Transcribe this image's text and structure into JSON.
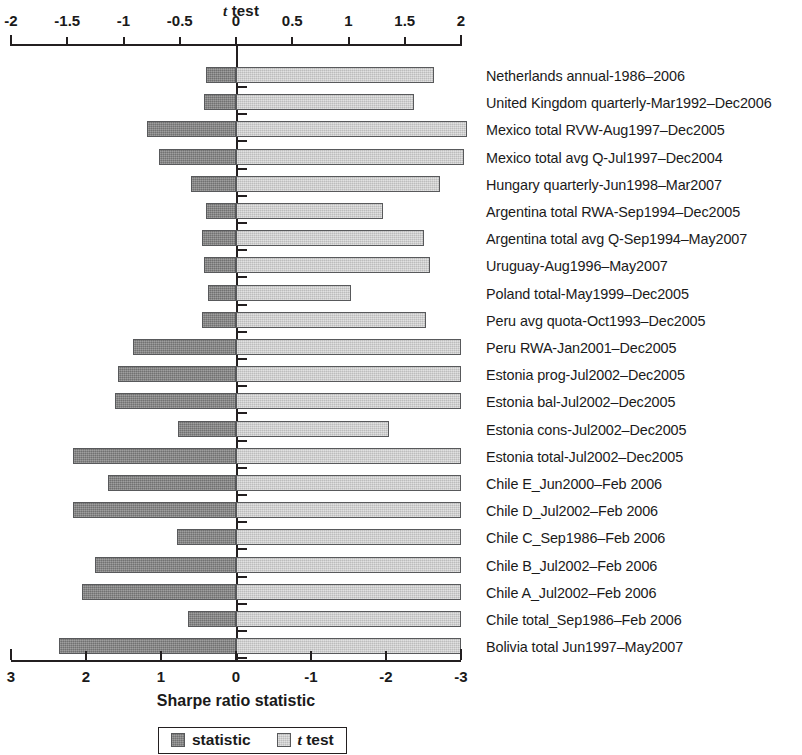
{
  "chart_data": {
    "type": "bar",
    "orientation": "horizontal",
    "title": "t test",
    "xlabel": "Sharpe ratio statistic",
    "ylabel": "",
    "grid": false,
    "legend_position": "bottom",
    "top_axis": {
      "label": "t test",
      "ticks": [
        "-2",
        "-1.5",
        "-1",
        "-0.5",
        "0",
        "0.5",
        "1",
        "1.5",
        "2"
      ],
      "tick_values": [
        -2,
        -1.5,
        -1,
        -0.5,
        0,
        0.5,
        1,
        1.5,
        2
      ],
      "range": [
        -2,
        2
      ]
    },
    "bottom_axis": {
      "label": "Sharpe ratio statistic",
      "ticks": [
        "3",
        "2",
        "1",
        "0",
        "-1",
        "-2",
        "-3"
      ],
      "tick_values": [
        3,
        2,
        1,
        0,
        -1,
        -2,
        -3
      ],
      "range": [
        3,
        -3
      ],
      "reversed": true
    },
    "legend": [
      {
        "name": "statistic",
        "color": "#878787"
      },
      {
        "name": "t test",
        "color": "#d2d2d2"
      }
    ],
    "categories": [
      "Netherlands annual-1986–2006",
      "United Kingdom quarterly-Mar1992–Dec2006",
      "Mexico total RVW-Aug1997–Dec2005",
      "Mexico total avg Q-Jul1997–Dec2004",
      "Hungary quarterly-Jun1998–Mar2007",
      "Argentina total RWA-Sep1994–Dec2005",
      "Argentina total avg Q-Sep1994–May2007",
      "Uruguay-Aug1996–May2007",
      "Poland total-May1999–Dec2005",
      "Peru avg quota-Oct1993–Dec2005",
      "Peru RWA-Jan2001–Dec2005",
      "Estonia prog-Jul2002–Dec2005",
      "Estonia bal-Jul2002–Dec2005",
      "Estonia cons-Jul2002–Dec2005",
      "Estonia total-Jul2002–Dec2005",
      "Chile E_Jun2000–Feb 2006",
      "Chile D_Jul2002–Feb 2006",
      "Chile C_Sep1986–Feb 2006",
      "Chile B_Jul2002–Feb 2006",
      "Chile A_Jul2002–Feb 2006",
      "Chile total_Sep1986–Feb 2006",
      "Bolivia total Jun1997–May2007"
    ],
    "series": [
      {
        "name": "statistic",
        "color": "#878787",
        "values": [
          0.4,
          0.43,
          1.19,
          1.03,
          0.6,
          0.4,
          0.45,
          0.43,
          0.37,
          0.45,
          1.37,
          1.57,
          1.62,
          0.77,
          2.17,
          1.71,
          2.17,
          0.79,
          1.88,
          2.05,
          0.64,
          2.36
        ]
      },
      {
        "name": "t test",
        "color": "#d2d2d2",
        "values": [
          1.76,
          1.58,
          2.05,
          2.03,
          1.81,
          1.31,
          1.67,
          1.72,
          1.02,
          1.69,
          2.0,
          2.0,
          2.0,
          1.36,
          2.0,
          2.0,
          2.0,
          2.0,
          2.0,
          2.0,
          2.0,
          2.0
        ]
      }
    ]
  },
  "legend": {
    "statistic_label": "statistic",
    "ttest_label_italic": "t",
    "ttest_label_rest": " test"
  },
  "axis_titles": {
    "top_italic": "t",
    "top_rest": " test",
    "bottom": "Sharpe ratio statistic"
  }
}
